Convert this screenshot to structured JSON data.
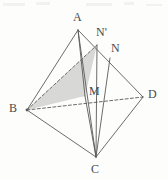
{
  "figure": {
    "type": "geometry-diagram",
    "width": 168,
    "height": 180,
    "background_color": "#fdfdfc",
    "line_color": "#5a5a5a",
    "shade_color": "#d8d8d6",
    "label_color": "#4a4a4a"
  },
  "labels": {
    "A": "A",
    "B": "B",
    "C": "C",
    "D": "D",
    "M": "M",
    "N": "N",
    "Nprime": "N'"
  },
  "label_positions": {
    "A": {
      "x": 73,
      "y": 11
    },
    "B": {
      "x": 9,
      "y": 102
    },
    "C": {
      "x": 91,
      "y": 163
    },
    "D": {
      "x": 148,
      "y": 88
    },
    "M": {
      "x": 89,
      "y": 85
    },
    "N": {
      "x": 111,
      "y": 42
    },
    "Nprime": {
      "x": 96,
      "y": 26
    }
  },
  "points": {
    "A": {
      "x": 78,
      "y": 30
    },
    "B": {
      "x": 27,
      "y": 110
    },
    "C": {
      "x": 96,
      "y": 157
    },
    "D": {
      "x": 143,
      "y": 97
    },
    "M": {
      "x": 85,
      "y": 96
    },
    "N": {
      "x": 110,
      "y": 58
    },
    "Nprime": {
      "x": 97,
      "y": 45
    }
  },
  "edges": [
    {
      "name": "edge-AB",
      "from": "A",
      "to": "B",
      "style": "solid"
    },
    {
      "name": "edge-AC",
      "from": "A",
      "to": "C",
      "style": "solid"
    },
    {
      "name": "edge-AD",
      "from": "A",
      "to": "D",
      "style": "solid"
    },
    {
      "name": "edge-BC",
      "from": "B",
      "to": "C",
      "style": "solid"
    },
    {
      "name": "edge-CD",
      "from": "C",
      "to": "D",
      "style": "solid"
    },
    {
      "name": "edge-BD",
      "from": "B",
      "to": "D",
      "style": "dashed"
    },
    {
      "name": "segment-BNprime",
      "from": "B",
      "to": "Nprime",
      "style": "dashed"
    },
    {
      "name": "segment-NprimeC",
      "from": "Nprime",
      "to": "C",
      "style": "solid"
    },
    {
      "name": "segment-NC",
      "from": "N",
      "to": "C",
      "style": "solid"
    },
    {
      "name": "segment-AM",
      "from": "A",
      "to": "M",
      "style": "solid"
    },
    {
      "name": "segment-MC",
      "from": "M",
      "to": "C",
      "style": "solid"
    }
  ],
  "shaded_region": {
    "name": "triangle-B-M-Nprime",
    "vertices": [
      "B",
      "M",
      "Nprime"
    ],
    "fill": "#d8d8d6"
  },
  "artifacts": [
    {
      "x": 3,
      "y": 3,
      "w": 22,
      "h": 3
    },
    {
      "x": 36,
      "y": 2,
      "w": 14,
      "h": 3
    },
    {
      "x": 86,
      "y": 3,
      "w": 26,
      "h": 3
    },
    {
      "x": 124,
      "y": 2,
      "w": 10,
      "h": 3
    },
    {
      "x": 146,
      "y": 4,
      "w": 16,
      "h": 2
    }
  ]
}
